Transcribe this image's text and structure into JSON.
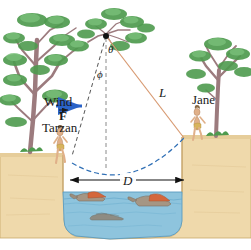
{
  "figure": {
    "labels": {
      "wind": "Wind",
      "force": "F",
      "tarzan": "Tarzan",
      "jane": "Jane",
      "rope_length": "L",
      "distance": "D",
      "angle_theta": "θ",
      "angle_phi": "ϕ"
    },
    "colors": {
      "ground": "#efd9ab",
      "ground_edge": "#c8a86a",
      "water": "#8ec4dd",
      "water_line": "#5a9bc0",
      "foliage": "#4e9a4e",
      "foliage_light": "#7cc07c",
      "trunk": "#9c7b7e",
      "rope": "#d89a72",
      "trajectory": "#2f6fb5",
      "dimension": "#111111",
      "skin": "#e0b089",
      "loincloth": "#d8b35e",
      "croc_body": "#a59684",
      "croc_mouth": "#d4673c",
      "wind_arrow": "#2a63c8",
      "grass": "#4e9a4e"
    },
    "elements": {
      "pivot": "rope anchor point on tree branch",
      "crocodiles": 3,
      "trees": 3,
      "people": 2
    }
  }
}
